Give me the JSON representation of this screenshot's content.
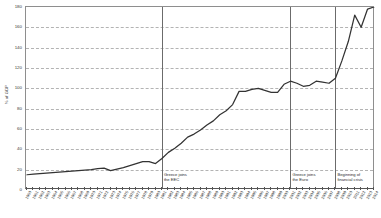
{
  "chart_data": {
    "type": "line",
    "title": "",
    "xlabel": "",
    "ylabel": "% of GDP",
    "ylim": [
      0,
      180
    ],
    "ytick_values": [
      0,
      20,
      40,
      60,
      80,
      100,
      120,
      140,
      160,
      180
    ],
    "ytick_labels": [
      "0",
      "20",
      "40",
      "60",
      "80",
      "100",
      "120",
      "140",
      "160",
      "180"
    ],
    "grid": "horizontal-dashed",
    "legend": "none",
    "xlim": [
      1960,
      2014
    ],
    "x": [
      1960,
      1961,
      1962,
      1963,
      1964,
      1965,
      1966,
      1967,
      1968,
      1969,
      1970,
      1971,
      1972,
      1973,
      1974,
      1975,
      1976,
      1977,
      1978,
      1979,
      1980,
      1981,
      1982,
      1983,
      1984,
      1985,
      1986,
      1987,
      1988,
      1989,
      1990,
      1991,
      1992,
      1993,
      1994,
      1995,
      1996,
      1997,
      1998,
      1999,
      2000,
      2001,
      2002,
      2003,
      2004,
      2005,
      2006,
      2007,
      2008,
      2009,
      2010,
      2011,
      2012,
      2013,
      2014
    ],
    "xtick_labels": [
      "1960",
      "1961",
      "1962",
      "1963",
      "1964",
      "1965",
      "1966",
      "1967",
      "1968",
      "1969",
      "1970",
      "1971",
      "1972",
      "1973",
      "1974",
      "1975",
      "1976",
      "1977",
      "1978",
      "1979",
      "1980",
      "1981",
      "1982",
      "1983",
      "1984",
      "1985",
      "1986",
      "1987",
      "1988",
      "1989",
      "1990",
      "1991",
      "1992",
      "1993",
      "1994",
      "1995",
      "1996",
      "1997",
      "1998",
      "1999",
      "2000",
      "2001",
      "2002",
      "2003",
      "2004",
      "2005",
      "2006",
      "2007",
      "2008",
      "2009",
      "2010",
      "2011",
      "2012",
      "2013",
      "2014"
    ],
    "series": [
      {
        "name": "Greece government debt",
        "color": "#333333",
        "values": [
          15,
          15.5,
          16,
          16.5,
          17,
          17.5,
          18,
          18.5,
          19,
          19.5,
          20,
          21,
          21.5,
          19,
          20.5,
          22,
          24,
          26,
          28,
          28,
          26,
          31,
          37,
          41,
          46,
          52,
          55,
          59,
          64,
          68,
          74,
          78,
          84,
          97,
          97,
          99,
          100,
          98,
          96,
          96,
          104,
          107,
          105,
          102,
          103,
          107,
          106,
          105,
          110,
          127,
          146,
          172,
          160,
          178,
          180
        ],
        "annotations": [
          {
            "x": 1981,
            "label": "Greece joins\nthe EEC"
          },
          {
            "x": 2001,
            "label": "Greece joins\nthe Euro"
          },
          {
            "x": 2008,
            "label": "Beginning of\nfinancial crisis"
          }
        ]
      }
    ]
  }
}
